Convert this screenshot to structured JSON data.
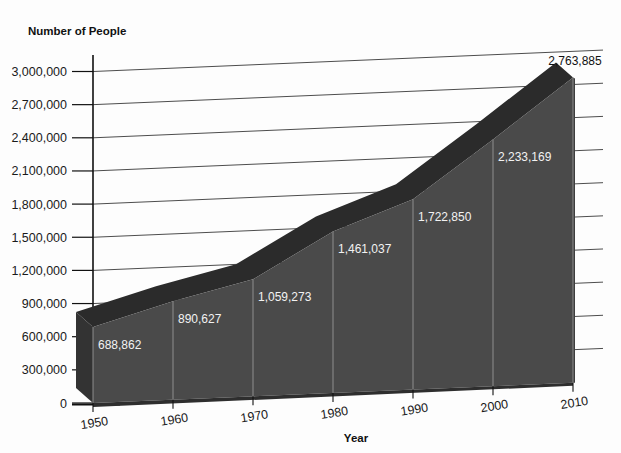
{
  "chart_data": {
    "type": "area",
    "title": "",
    "ylabel": "Number of People",
    "xlabel": "Year",
    "categories": [
      "1950",
      "1960",
      "1970",
      "1980",
      "1990",
      "2000",
      "2010"
    ],
    "values": [
      688862,
      890627,
      1059273,
      1461037,
      1722850,
      2233169,
      2763885
    ],
    "value_labels": [
      "688,862",
      "890,627",
      "1,059,273",
      "1,461,037",
      "1,722,850",
      "2,233,169",
      "2,763,885"
    ],
    "ylim": [
      0,
      3000000
    ],
    "ytick_labels": [
      "3,000,000",
      "2,700,000",
      "2,400,000",
      "2,100,000",
      "1,800,000",
      "1,500,000",
      "1,200,000",
      "900,000",
      "600,000",
      "300,000",
      "0"
    ],
    "ytick_values": [
      3000000,
      2700000,
      2400000,
      2100000,
      1800000,
      1500000,
      1200000,
      900000,
      600000,
      300000,
      0
    ],
    "grid": true,
    "legend": "none",
    "style": "3d-area",
    "colors": {
      "front_face": "#4a4a4a",
      "top_face": "#2b2b2b",
      "side_face": "#343434",
      "gridline": "#4d4d4d",
      "axis": "#111111",
      "label_text": "#f2f2f2",
      "background": "#fdfdfd"
    }
  },
  "labels": {
    "y_axis_title": "Number of People",
    "x_axis_title": "Year"
  }
}
